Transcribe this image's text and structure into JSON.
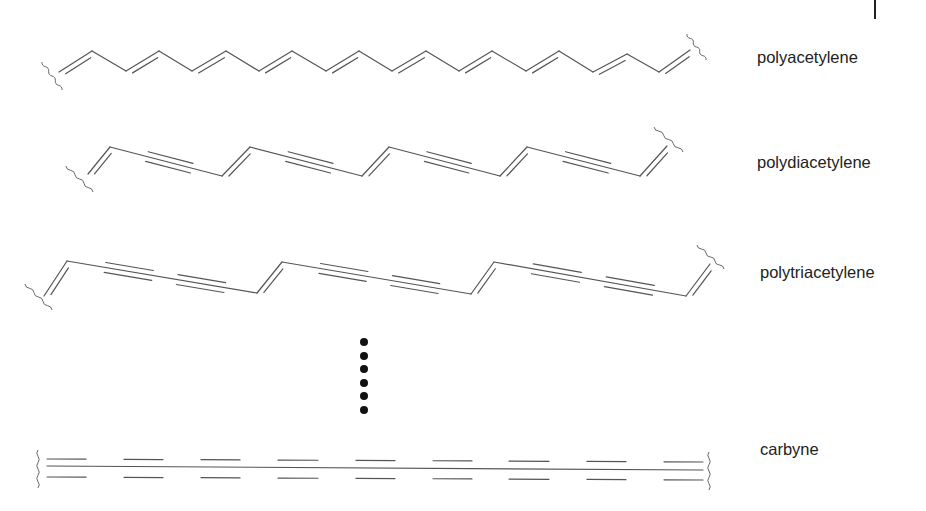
{
  "figure": {
    "polymers": [
      {
        "id": "polyacetylene",
        "label": "polyacetylene",
        "label_pos": [
          757,
          60
        ],
        "repeat_unit": "ene",
        "vertices": [
          [
            59,
            72
          ],
          [
            92,
            51
          ],
          [
            126,
            71
          ],
          [
            159,
            51
          ],
          [
            192,
            71
          ],
          [
            226,
            51
          ],
          [
            259,
            71
          ],
          [
            292,
            51
          ],
          [
            326,
            71
          ],
          [
            359,
            51
          ],
          [
            392,
            71
          ],
          [
            426,
            51
          ],
          [
            459,
            71
          ],
          [
            492,
            51
          ],
          [
            526,
            71
          ],
          [
            559,
            51
          ],
          [
            593,
            72
          ],
          [
            627,
            54
          ],
          [
            659,
            72
          ],
          [
            690,
            50
          ]
        ],
        "start_wave": {
          "x1": 42,
          "y1": 62,
          "x2": 62,
          "y2": 90
        },
        "end_wave": {
          "x1": 687,
          "y1": 34,
          "x2": 706,
          "y2": 60
        }
      },
      {
        "id": "polydiacetylene",
        "label": "polydiacetylene",
        "label_pos": [
          757,
          165
        ],
        "repeat_unit": "ene-yne",
        "vertices": [
          [
            88,
            174
          ],
          [
            110,
            147
          ],
          [
            222,
            176
          ],
          [
            250,
            147
          ],
          [
            362,
            176
          ],
          [
            389,
            147
          ],
          [
            500,
            176
          ],
          [
            527,
            147
          ],
          [
            640,
            176
          ],
          [
            667,
            146
          ]
        ],
        "start_wave": {
          "x1": 66,
          "y1": 166,
          "x2": 93,
          "y2": 192
        },
        "end_wave": {
          "x1": 654,
          "y1": 127,
          "x2": 683,
          "y2": 152
        }
      },
      {
        "id": "polytriacetylene",
        "label": "polytriacetylene",
        "label_pos": [
          760,
          275
        ],
        "repeat_unit": "ene-yne-yne",
        "vertices": [
          [
            44,
            296
          ],
          [
            67,
            261
          ],
          [
            257,
            293
          ],
          [
            282,
            262
          ],
          [
            471,
            294
          ],
          [
            494,
            262
          ],
          [
            686,
            296
          ],
          [
            710,
            264
          ]
        ],
        "start_wave": {
          "x1": 25,
          "y1": 284,
          "x2": 52,
          "y2": 310
        },
        "end_wave": {
          "x1": 697,
          "y1": 245,
          "x2": 724,
          "y2": 269
        }
      }
    ],
    "ellipsis_dots": {
      "x": 364,
      "ys": [
        342,
        356,
        369,
        383,
        396,
        410
      ],
      "r": 4
    },
    "carbyne": {
      "label": "carbyne",
      "label_pos": [
        760,
        452
      ],
      "main_line": {
        "x1": 47,
        "y1": 466,
        "x2": 703,
        "y2": 470
      },
      "bar_segments": [
        [
          47,
          86
        ],
        [
          124,
          163
        ],
        [
          201,
          240
        ],
        [
          278,
          318
        ],
        [
          356,
          395
        ],
        [
          433,
          472
        ],
        [
          509,
          549
        ],
        [
          587,
          626
        ],
        [
          664,
          703
        ]
      ],
      "upper_y": [
        459,
        462
      ],
      "lower_y": [
        477,
        480
      ],
      "start_wave": {
        "x": 38,
        "y1": 450,
        "y2": 488
      },
      "end_wave": {
        "x": 709,
        "y1": 452,
        "y2": 490
      }
    },
    "labels": {
      "polyacetylene": "polyacetylene",
      "polydiacetylene": "polydiacetylene",
      "polytriacetylene": "polytriacetylene",
      "carbyne": "carbyne"
    }
  }
}
